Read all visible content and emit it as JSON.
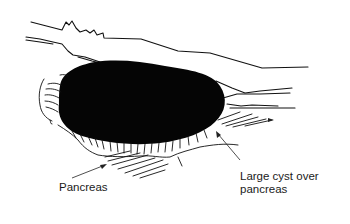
{
  "figure": {
    "type": "medical line illustration",
    "colors": {
      "ink": "#111111",
      "cyst_fill": "#050505",
      "background": "#ffffff",
      "label_text": "#1a1a1a"
    }
  },
  "labels": {
    "pancreas": "Pancreas",
    "cyst_line1": "Large cyst over",
    "cyst_line2": "pancreas"
  }
}
